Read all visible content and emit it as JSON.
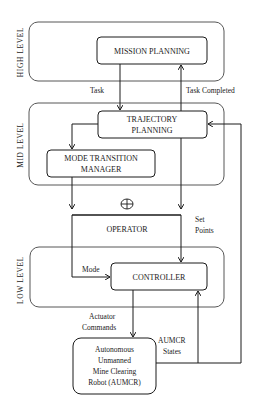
{
  "diagram": {
    "levels": [
      {
        "id": "high",
        "label": "HIGH LEVEL"
      },
      {
        "id": "mid",
        "label": "MID LEVEL"
      },
      {
        "id": "low",
        "label": "LOW LEVEL"
      }
    ],
    "nodes": {
      "mission_planning": {
        "label": "MISSION PLANNING"
      },
      "trajectory_planning": {
        "line1": "TRAJECTORY",
        "line2": "PLANNING"
      },
      "mode_transition_manager": {
        "line1": "MODE TRANSITION",
        "line2": "MANAGER"
      },
      "operator": {
        "label": "OPERATOR",
        "symbol": "⊕"
      },
      "controller": {
        "label": "CONTROLLER"
      },
      "aumcr": {
        "line1": "Autonomous",
        "line2": "Unmanned",
        "line3": "Mine Clearing",
        "line4": "Robot (AUMCR)"
      }
    },
    "edges": {
      "task": "Task",
      "task_completed": "Task Completed",
      "set_points_1": "Set",
      "set_points_2": "Points",
      "mode": "Mode",
      "actuator_1": "Actuator",
      "actuator_2": "Commands",
      "states_1": "AUMCR",
      "states_2": "States"
    }
  }
}
